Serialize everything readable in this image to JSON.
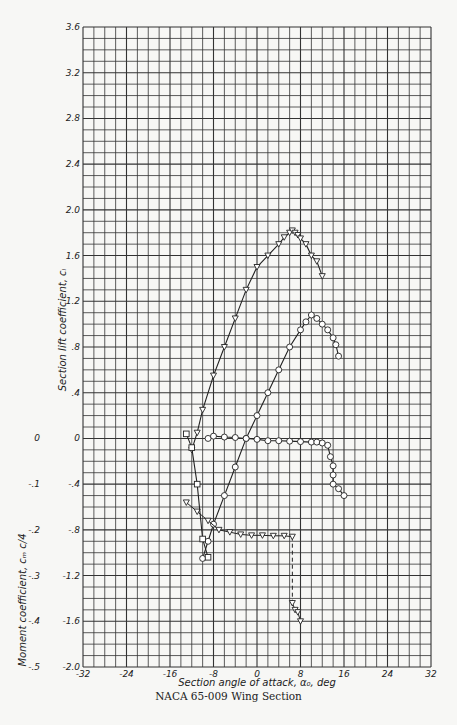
{
  "chart_data": {
    "type": "line",
    "title": "NACA 65-009 Wing Section",
    "xlabel": "Section angle of attack, α₀, deg",
    "ylabel": "Section lift coefficient, cₗ",
    "ylabel_secondary": "Moment coefficient, cₘ c/4",
    "xlim": [
      -32,
      32
    ],
    "ylim": [
      -2.0,
      3.6
    ],
    "ylim_secondary": [
      -0.5,
      0.0
    ],
    "grid": true,
    "x_ticks": [
      -32,
      -24,
      -16,
      -8,
      0,
      8,
      16,
      24,
      32
    ],
    "y_ticks": [
      "-2.0",
      "-1.6",
      "-1.2",
      "-.8",
      "-.4",
      "0",
      ".4",
      ".8",
      "1.2",
      "1.6",
      "2.0",
      "2.4",
      "2.8",
      "3.2",
      "3.6"
    ],
    "y_tick_values": [
      -2.0,
      -1.6,
      -1.2,
      -0.8,
      -0.4,
      0,
      0.4,
      0.8,
      1.2,
      1.6,
      2.0,
      2.4,
      2.8,
      3.2,
      3.6
    ],
    "y2_ticks": [
      "0",
      "-.1",
      "-.2",
      "-.3",
      "-.4",
      "-.5"
    ],
    "y2_tick_values": [
      0,
      -0.1,
      -0.2,
      -0.3,
      -0.4,
      -0.5
    ],
    "series": [
      {
        "name": "Lift, flapped (triangles)",
        "marker": "triangle",
        "x": [
          -12,
          -11,
          -10,
          -8,
          -6,
          -4,
          -2,
          0,
          2,
          4,
          5,
          6,
          6.5,
          7,
          7.5,
          8,
          9,
          10,
          11,
          12
        ],
        "y": [
          -0.1,
          0.05,
          0.25,
          0.55,
          0.8,
          1.05,
          1.3,
          1.5,
          1.6,
          1.7,
          1.76,
          1.8,
          1.82,
          1.8,
          1.78,
          1.75,
          1.7,
          1.6,
          1.55,
          1.42
        ]
      },
      {
        "name": "Lift, plain (circles/squares)",
        "marker": "circle",
        "x": [
          -10,
          -9,
          -8,
          -6,
          -4,
          -2,
          0,
          2,
          4,
          6,
          8,
          9,
          10,
          11,
          12,
          13,
          14,
          14.5,
          15
        ],
        "y": [
          -1.05,
          -0.9,
          -0.75,
          -0.5,
          -0.25,
          0.0,
          0.2,
          0.4,
          0.6,
          0.8,
          0.95,
          1.02,
          1.08,
          1.05,
          1.0,
          0.95,
          0.88,
          0.82,
          0.72
        ]
      },
      {
        "name": "Moment, plain (circles)",
        "axis": "secondary",
        "marker": "circle",
        "x": [
          -9,
          -8,
          -6,
          -4,
          -2,
          0,
          2,
          4,
          6,
          8,
          10,
          11,
          12,
          13,
          13.5,
          14,
          14,
          14,
          15,
          16
        ],
        "y": [
          0.0,
          0.005,
          0.003,
          0.002,
          0.0,
          -0.002,
          -0.005,
          -0.005,
          -0.006,
          -0.007,
          -0.008,
          -0.008,
          -0.01,
          -0.015,
          -0.04,
          -0.06,
          -0.08,
          -0.1,
          -0.11,
          -0.125
        ]
      },
      {
        "name": "Moment, flapped (triangles)",
        "axis": "secondary",
        "marker": "triangle",
        "x": [
          -13,
          -11,
          -9,
          -7,
          -5,
          -3,
          -1,
          1,
          3,
          5,
          6.5,
          6.5,
          7,
          7.5,
          8
        ],
        "y": [
          -0.14,
          -0.16,
          -0.18,
          -0.2,
          -0.205,
          -0.21,
          -0.212,
          -0.212,
          -0.213,
          -0.213,
          -0.215,
          -0.36,
          -0.375,
          -0.38,
          -0.4
        ]
      },
      {
        "name": "Moment, left branch (squares)",
        "axis": "secondary",
        "marker": "square",
        "x": [
          -13,
          -12,
          -11,
          -10,
          -9
        ],
        "y": [
          0.01,
          -0.02,
          -0.1,
          -0.22,
          -0.26
        ]
      }
    ],
    "annotations": [
      "NACA 65-009 Wing Section"
    ]
  },
  "labels": {
    "x_axis_title": "Section angle of attack, α₀, deg",
    "y_axis_title": "Section lift coefficient, cₗ",
    "y2_axis_title": "Moment coefficient, cₘ c/4",
    "caption": "NACA 65-009 Wing Section"
  }
}
